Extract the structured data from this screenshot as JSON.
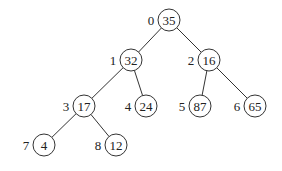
{
  "tree": {
    "nodes": [
      {
        "index": "0",
        "value": "35",
        "cx": 169,
        "cy": 20
      },
      {
        "index": "1",
        "value": "32",
        "cx": 131,
        "cy": 60
      },
      {
        "index": "2",
        "value": "16",
        "cx": 209,
        "cy": 60
      },
      {
        "index": "3",
        "value": "17",
        "cx": 84,
        "cy": 106
      },
      {
        "index": "4",
        "value": "24",
        "cx": 146,
        "cy": 106
      },
      {
        "index": "5",
        "value": "87",
        "cx": 200,
        "cy": 106
      },
      {
        "index": "6",
        "value": "65",
        "cx": 255,
        "cy": 106
      },
      {
        "index": "7",
        "value": "4",
        "cx": 44,
        "cy": 145
      },
      {
        "index": "8",
        "value": "12",
        "cx": 116,
        "cy": 145
      }
    ],
    "edges": [
      [
        0,
        1
      ],
      [
        0,
        2
      ],
      [
        1,
        3
      ],
      [
        1,
        4
      ],
      [
        2,
        5
      ],
      [
        2,
        6
      ],
      [
        3,
        7
      ],
      [
        3,
        8
      ]
    ]
  }
}
